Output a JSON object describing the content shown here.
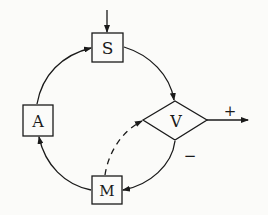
{
  "diagram": {
    "nodes": [
      {
        "id": "S",
        "label": "S",
        "shape": "box"
      },
      {
        "id": "V",
        "label": "V",
        "shape": "diamond"
      },
      {
        "id": "M",
        "label": "M",
        "shape": "box"
      },
      {
        "id": "A",
        "label": "A",
        "shape": "box"
      }
    ],
    "edges": [
      {
        "from": "input",
        "to": "S",
        "style": "solid"
      },
      {
        "from": "S",
        "to": "V",
        "style": "solid"
      },
      {
        "from": "V",
        "to": "M",
        "style": "solid",
        "label": "−"
      },
      {
        "from": "M",
        "to": "A",
        "style": "solid"
      },
      {
        "from": "A",
        "to": "S",
        "style": "solid"
      },
      {
        "from": "M",
        "to": "V",
        "style": "dashed"
      },
      {
        "from": "V",
        "to": "output",
        "style": "solid",
        "label": "+"
      }
    ],
    "labels": {
      "S": "S",
      "V": "V",
      "M": "M",
      "A": "A",
      "plus": "+",
      "minus": "−"
    },
    "colors": {
      "ink": "#1a1a1a",
      "background": "#fbfbf9"
    }
  }
}
